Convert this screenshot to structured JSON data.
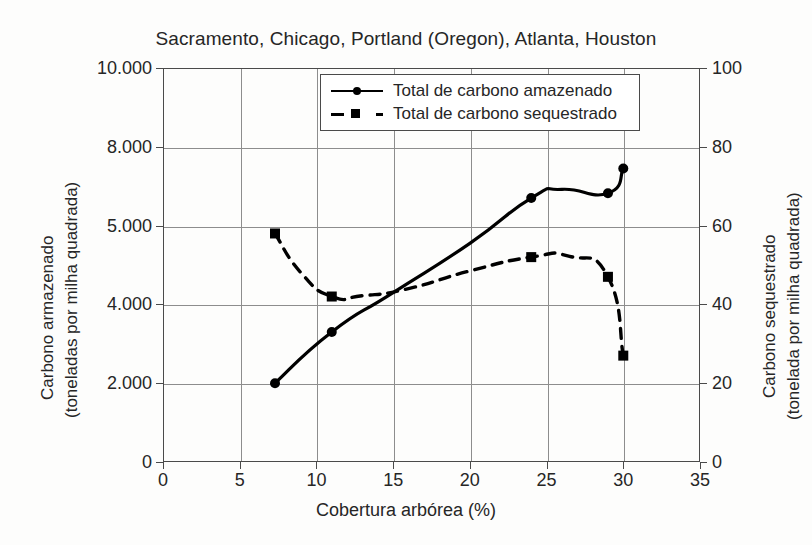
{
  "chart_data": {
    "type": "line",
    "title": "Sacramento, Chicago, Portland (Oregon), Atlanta, Houston",
    "xlabel": "Cobertura arbórea (%)",
    "ylabel_left_line1": "Carbono armazenado",
    "ylabel_left_line2": "(toneladas por milha quadrada)",
    "ylabel_right_line1": "Carbono sequestrado",
    "ylabel_right_line2": "(tonelada por milha quadrada)",
    "grid": true,
    "legend_position": "top-center",
    "xlim": [
      0,
      35
    ],
    "xticks": [
      "0",
      "5",
      "10",
      "15",
      "20",
      "25",
      "30",
      "35"
    ],
    "xtick_values": [
      0,
      5,
      10,
      15,
      20,
      25,
      30,
      35
    ],
    "left_axis": {
      "label": "Carbono armazenado (toneladas por milha quadrada)",
      "ticks": [
        "0",
        "2.000",
        "4.000",
        "5.000",
        "8.000",
        "10.000"
      ],
      "tick_positions_fraction": [
        0,
        0.2,
        0.4,
        0.6,
        0.8,
        1.0
      ],
      "ylim": [
        0,
        10000
      ]
    },
    "right_axis": {
      "label": "Carbono sequestrado (tonelada por milha quadrada)",
      "ticks": [
        "0",
        "20",
        "40",
        "60",
        "80",
        "100"
      ],
      "tick_values": [
        0,
        20,
        40,
        60,
        80,
        100
      ],
      "ylim": [
        0,
        100
      ]
    },
    "series": [
      {
        "name": "Total de carbono amazenado",
        "axis": "right-scale",
        "style": "solid",
        "marker": "circle",
        "color": "#000000",
        "x": [
          7.3,
          11.0,
          15.0,
          20.0,
          24.0,
          26.0,
          29.0,
          30.0
        ],
        "values": [
          20.0,
          33.0,
          43.0,
          55.5,
          67.0,
          69.2,
          68.2,
          74.5
        ],
        "marker_x": [
          7.3,
          11.0,
          24.0,
          29.0,
          30.0
        ],
        "marker_values": [
          20.0,
          33.0,
          67.0,
          68.2,
          74.5
        ]
      },
      {
        "name": "Total de carbono sequestrado",
        "axis": "right-scale",
        "style": "dashed",
        "marker": "square",
        "color": "#000000",
        "x": [
          7.3,
          9.0,
          11.0,
          13.0,
          16.0,
          20.0,
          24.0,
          26.5,
          29.0,
          30.0
        ],
        "values": [
          58.0,
          48.0,
          42.0,
          42.2,
          44.0,
          48.5,
          52.0,
          52.2,
          47.0,
          27.0
        ],
        "marker_x": [
          7.3,
          11.0,
          24.0,
          29.0,
          30.0
        ],
        "marker_values": [
          58.0,
          42.0,
          52.0,
          47.0,
          27.0
        ]
      }
    ]
  },
  "legend": {
    "items": [
      {
        "label": "Total de carbono amazenado"
      },
      {
        "label": "Total de carbono sequestrado"
      }
    ]
  }
}
